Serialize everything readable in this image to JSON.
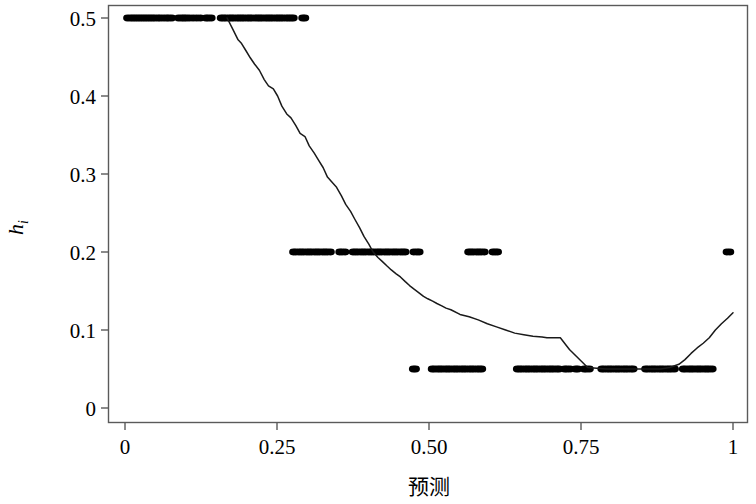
{
  "chart_data": {
    "type": "scatter",
    "title": "",
    "xlabel": "预测",
    "ylabel": "ĥᵢ",
    "ylabel_base": "h",
    "ylabel_hat": "ˆ",
    "ylabel_sub": "i",
    "xlim": [
      -0.02,
      1.02
    ],
    "ylim": [
      -0.012,
      0.535
    ],
    "xticks": [
      0,
      0.25,
      0.5,
      0.75,
      1
    ],
    "xtick_labels": [
      "0",
      "0.25",
      "0.50",
      "0.75",
      "1"
    ],
    "yticks": [
      0,
      0.1,
      0.2,
      0.3,
      0.4,
      0.5
    ],
    "ytick_labels": [
      "0",
      "0.1",
      "0.2",
      "0.3",
      "0.4",
      "0.5"
    ],
    "grid": false,
    "legend": false,
    "frame": "box",
    "point_color": "#000000",
    "line_color": "#1a1a1a",
    "point_radius": 3.4,
    "series": [
      {
        "name": "观测点 (leverage vs prediction)",
        "type": "scatter",
        "marker": "filled-circle",
        "points_y05": [
          0.004,
          0.009,
          0.013,
          0.017,
          0.021,
          0.025,
          0.029,
          0.033,
          0.037,
          0.041,
          0.045,
          0.049,
          0.054,
          0.058,
          0.063,
          0.068,
          0.072,
          0.077,
          0.088,
          0.093,
          0.097,
          0.101,
          0.106,
          0.112,
          0.118,
          0.124,
          0.133,
          0.137,
          0.142,
          0.158,
          0.162,
          0.166,
          0.171,
          0.175,
          0.179,
          0.184,
          0.188,
          0.192,
          0.196,
          0.201,
          0.205,
          0.209,
          0.214,
          0.218,
          0.222,
          0.226,
          0.231,
          0.235,
          0.239,
          0.243,
          0.248,
          0.252,
          0.256,
          0.26,
          0.265,
          0.269,
          0.273,
          0.277,
          0.292,
          0.296
        ],
        "points_y02": [
          0.277,
          0.281,
          0.286,
          0.29,
          0.294,
          0.299,
          0.303,
          0.307,
          0.312,
          0.316,
          0.32,
          0.325,
          0.329,
          0.333,
          0.338,
          0.353,
          0.357,
          0.362,
          0.375,
          0.379,
          0.383,
          0.388,
          0.392,
          0.396,
          0.401,
          0.405,
          0.409,
          0.414,
          0.418,
          0.422,
          0.427,
          0.431,
          0.435,
          0.44,
          0.444,
          0.448,
          0.453,
          0.457,
          0.461,
          0.475,
          0.48,
          0.484,
          0.565,
          0.569,
          0.573,
          0.578,
          0.582,
          0.586,
          0.591,
          0.605,
          0.609,
          0.613,
          0.99,
          0.995
        ],
        "points_y005": [
          0.474,
          0.478,
          0.505,
          0.509,
          0.514,
          0.518,
          0.522,
          0.527,
          0.531,
          0.535,
          0.54,
          0.544,
          0.548,
          0.553,
          0.557,
          0.561,
          0.566,
          0.57,
          0.574,
          0.579,
          0.583,
          0.587,
          0.645,
          0.649,
          0.653,
          0.658,
          0.662,
          0.666,
          0.671,
          0.675,
          0.679,
          0.684,
          0.688,
          0.692,
          0.697,
          0.701,
          0.705,
          0.71,
          0.714,
          0.723,
          0.727,
          0.732,
          0.741,
          0.745,
          0.755,
          0.759,
          0.764,
          0.784,
          0.788,
          0.793,
          0.797,
          0.801,
          0.806,
          0.81,
          0.814,
          0.819,
          0.823,
          0.827,
          0.832,
          0.836,
          0.856,
          0.86,
          0.865,
          0.869,
          0.873,
          0.878,
          0.882,
          0.886,
          0.891,
          0.895,
          0.899,
          0.904,
          0.918,
          0.922,
          0.927,
          0.931,
          0.935,
          0.94,
          0.944,
          0.948,
          0.953,
          0.957,
          0.961,
          0.966
        ]
      },
      {
        "name": "平滑曲线 (smoother)",
        "type": "line",
        "x": [
          0.168,
          0.177,
          0.186,
          0.191,
          0.199,
          0.206,
          0.213,
          0.221,
          0.229,
          0.236,
          0.244,
          0.251,
          0.258,
          0.266,
          0.273,
          0.281,
          0.288,
          0.296,
          0.303,
          0.311,
          0.318,
          0.326,
          0.333,
          0.341,
          0.348,
          0.356,
          0.363,
          0.371,
          0.378,
          0.386,
          0.393,
          0.401,
          0.408,
          0.416,
          0.423,
          0.431,
          0.438,
          0.446,
          0.453,
          0.461,
          0.468,
          0.476,
          0.483,
          0.491,
          0.498,
          0.506,
          0.513,
          0.521,
          0.528,
          0.536,
          0.551,
          0.566,
          0.581,
          0.596,
          0.611,
          0.626,
          0.641,
          0.656,
          0.671,
          0.686,
          0.694,
          0.701,
          0.709,
          0.716,
          0.731,
          0.761,
          0.791,
          0.821,
          0.851,
          0.881,
          0.896,
          0.911,
          0.921,
          0.931,
          0.941,
          0.951,
          0.961,
          0.971,
          0.981,
          0.991,
          1.0
        ],
        "y": [
          0.5,
          0.486,
          0.472,
          0.468,
          0.458,
          0.449,
          0.441,
          0.433,
          0.421,
          0.413,
          0.409,
          0.4,
          0.387,
          0.377,
          0.372,
          0.362,
          0.352,
          0.348,
          0.336,
          0.327,
          0.318,
          0.308,
          0.296,
          0.289,
          0.283,
          0.272,
          0.261,
          0.252,
          0.242,
          0.231,
          0.22,
          0.21,
          0.2,
          0.193,
          0.188,
          0.182,
          0.177,
          0.172,
          0.168,
          0.162,
          0.157,
          0.152,
          0.148,
          0.143,
          0.14,
          0.137,
          0.134,
          0.131,
          0.128,
          0.126,
          0.12,
          0.117,
          0.113,
          0.108,
          0.104,
          0.1,
          0.096,
          0.094,
          0.092,
          0.091,
          0.09,
          0.09,
          0.09,
          0.09,
          0.075,
          0.052,
          0.05,
          0.05,
          0.05,
          0.05,
          0.052,
          0.056,
          0.062,
          0.07,
          0.077,
          0.083,
          0.09,
          0.1,
          0.108,
          0.115,
          0.122
        ]
      }
    ],
    "annotations": []
  },
  "axes": {
    "x_title": "预测",
    "y_title_display": "ĥᵢ",
    "x_tick_labels": [
      "0",
      "0.25",
      "0.50",
      "0.75",
      "1"
    ],
    "y_tick_labels": [
      "0",
      "0.1",
      "0.2",
      "0.3",
      "0.4",
      "0.5"
    ]
  },
  "colors": {
    "background": "#ffffff",
    "axis": "#5a5a5a",
    "ink": "#000000",
    "line": "#1a1a1a"
  }
}
